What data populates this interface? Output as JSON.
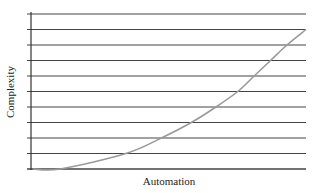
{
  "chart_data": {
    "type": "line",
    "title": "",
    "xlabel": "Automation",
    "ylabel": "Complexity",
    "grid": true,
    "grid_lines_y": 11,
    "legend": null,
    "xlim": [
      0,
      1
    ],
    "ylim": [
      0,
      10
    ],
    "x_ticks": [],
    "y_ticks": [],
    "series": [
      {
        "name": "Complexity vs Automation",
        "x": [
          0.0,
          0.1,
          0.34,
          0.47,
          0.58,
          0.67,
          0.75,
          0.81,
          0.87,
          0.93,
          1.0
        ],
        "y": [
          0,
          0,
          1,
          2,
          3,
          4,
          5,
          6,
          7,
          8,
          9
        ]
      }
    ],
    "colors": {
      "grid": "#444444",
      "axis": "#333333",
      "curve": "#9a9a9a"
    }
  }
}
